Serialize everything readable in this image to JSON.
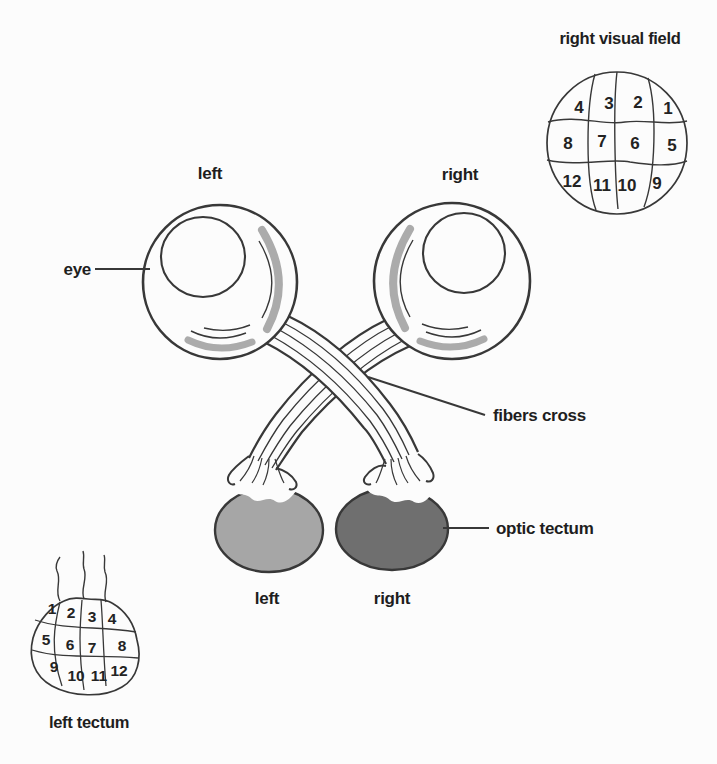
{
  "figure": {
    "labels": {
      "eye_pointer": "eye",
      "left_eye": "left",
      "right_eye": "right",
      "fibers_cross": "fibers cross",
      "optic_tectum": "optic tectum",
      "left_tectum": "left",
      "right_tectum": "right"
    },
    "right_visual_field": {
      "title": "right visual field",
      "cells": [
        "4",
        "3",
        "2",
        "1",
        "8",
        "7",
        "6",
        "5",
        "12",
        "11",
        "10",
        "9"
      ]
    },
    "left_tectum_map": {
      "caption": "left tectum",
      "cells": [
        "1",
        "2",
        "3",
        "4",
        "5",
        "6",
        "7",
        "8",
        "9",
        "10",
        "11",
        "12"
      ]
    },
    "colors": {
      "left_tectum_fill": "#a6a6a6",
      "right_tectum_fill": "#6f6f6f",
      "eye_shading": "#ababab"
    }
  }
}
